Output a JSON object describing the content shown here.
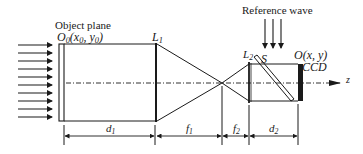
{
  "labels": {
    "object_plane": "Object plane",
    "o0_main": "O",
    "o0_sub": "0",
    "o0_coords_open": "(x",
    "o0_x_sub": "0",
    "o0_comma": ", y",
    "o0_y_sub": "0",
    "o0_close": ")",
    "l1_main": "L",
    "l1_sub": "1",
    "reference_wave": "Reference wave",
    "l2_main": "L",
    "l2_sub": "2",
    "splitter": "S",
    "ccd_origin": "O(x, y)",
    "ccd": "CCD",
    "axis": "z",
    "d1_main": "d",
    "d1_sub": "1",
    "f1_main": "f",
    "f1_sub": "1",
    "f2_main": "f",
    "f2_sub": "2",
    "d2_main": "d",
    "d2_sub": "2"
  },
  "colors": {
    "stroke": "#1a1a1a",
    "background": "#ffffff"
  }
}
